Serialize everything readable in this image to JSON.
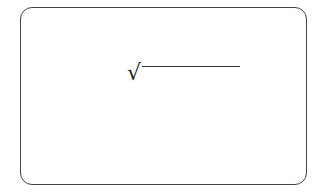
{
  "diagram": {
    "type": "math-expression-box",
    "frame": {
      "shape": "rounded-rectangle",
      "border_color": "#444444"
    },
    "expression": {
      "symbol": "√",
      "symbol_name": "square-root-radical",
      "radicand": ""
    }
  }
}
